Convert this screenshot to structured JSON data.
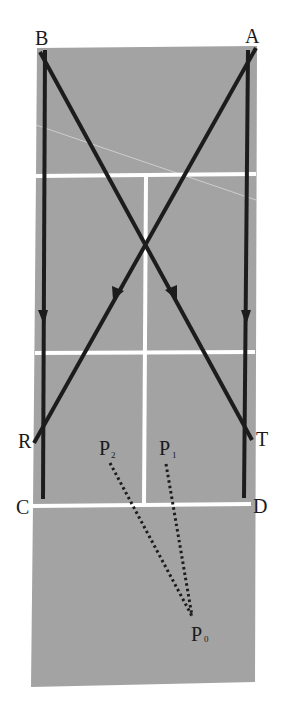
{
  "figure": {
    "type": "court-path-diagram",
    "colors": {
      "background": "#ffffff",
      "court": "#a3a3a3",
      "court_lines": "#ffffff",
      "paths": "#1c1c1c",
      "dotted": "#1c1c1c"
    },
    "labels": {
      "A": "A",
      "B": "B",
      "C": "C",
      "D": "D",
      "R": "R",
      "T": "T",
      "P0": "P",
      "P0_sub": "0",
      "P1": "P",
      "P1_sub": "1",
      "P2": "P",
      "P2_sub": "2"
    },
    "paths": [
      {
        "name": "B to C",
        "from": "B",
        "to": "C",
        "arrow": true
      },
      {
        "name": "A to D",
        "from": "A",
        "to": "D",
        "arrow": true
      },
      {
        "name": "B to T",
        "from": "B",
        "to": "T",
        "arrow": true
      },
      {
        "name": "A to R",
        "from": "A",
        "to": "R",
        "arrow": true
      }
    ],
    "dotted_lines": [
      {
        "from": "P2",
        "to": "P0"
      },
      {
        "from": "P1",
        "to": "P0"
      }
    ]
  }
}
